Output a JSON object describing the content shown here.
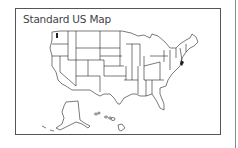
{
  "map": {
    "title": "Standard US Map",
    "regions": [
      "Contiguous United States",
      "Alaska",
      "Hawaii"
    ],
    "colors": {
      "state_fill": "#ffffff",
      "state_stroke": "#222222",
      "frame": "#555555"
    }
  }
}
